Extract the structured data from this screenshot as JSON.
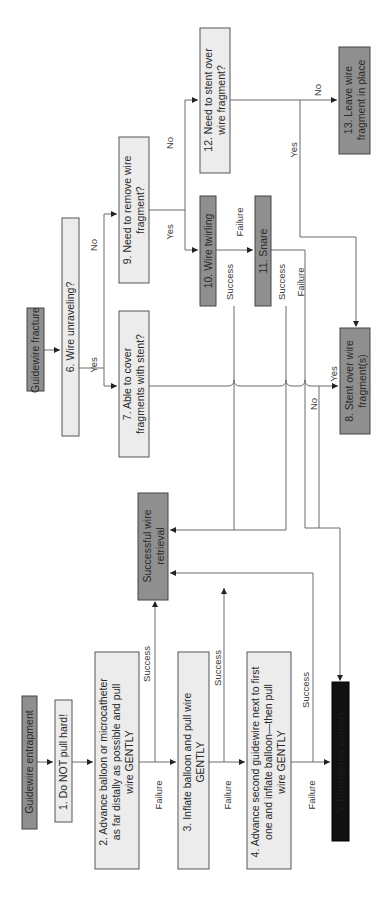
{
  "diagram": {
    "orientation": "rotated-90-ccw",
    "start_nodes": {
      "entrapment": "Guidewire entrapment",
      "fracture": "Guidewire fracture"
    },
    "nodes": {
      "n1": "1. Do NOT pull hard!",
      "n2_l1": "2. Advance balloon or microcatheter",
      "n2_l2": "as far distally as possible and pull",
      "n2_l3": "wire GENTLY",
      "success": "Successful wire",
      "success_l2": "retrieval",
      "n3_l1": "3. Inflate balloon and pull wire",
      "n3_l2": "GENTLY",
      "n4_l1": "4. Advance second guidewire next to first",
      "n4_l2": "one and inflate balloon—then pull",
      "n4_l3": "wire GENTLY",
      "n5": "5. Emergency surgery",
      "n6": "6. Wire unraveling?",
      "n7_l1": "7. Able to cover",
      "n7_l2": "fragments with stent?",
      "n8_l1": "8. Stent over wire",
      "n8_l2": "fragment(s)",
      "n9_l1": "9. Need to remove wire",
      "n9_l2": "fragment?",
      "n10": "10. Wire twirling",
      "n11": "11. Snare",
      "n12_l1": "12. Need to stent over",
      "n12_l2": "wire fragment?",
      "n13_l1": "13. Leave wire",
      "n13_l2": "fragment in place"
    },
    "edge_labels": {
      "success": "Success",
      "failure": "Failure",
      "yes": "Yes",
      "no": "No"
    },
    "colors": {
      "light_box": "#ececec",
      "dark_box": "#8f8f8f",
      "black_box": "#111111",
      "line": "#6a6a6a"
    }
  }
}
